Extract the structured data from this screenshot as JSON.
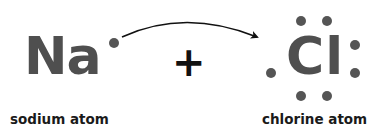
{
  "diagram": {
    "type": "lewis-dot-electron-transfer",
    "left_atom": {
      "symbol": "Na",
      "label": "sodium atom",
      "valence_electrons": 1
    },
    "operator": "+",
    "right_atom": {
      "symbol": "Cl",
      "label": "chlorine atom",
      "valence_electrons": 7
    },
    "arrow": {
      "from": "Na valence electron",
      "to": "Cl vacant electron position",
      "style": "curved"
    },
    "colors": {
      "symbol": "#4f4f4f",
      "electron": "#555555",
      "plus": "#111111",
      "label": "#1a1a1a",
      "arrow": "#111111",
      "background": "#ffffff"
    }
  }
}
